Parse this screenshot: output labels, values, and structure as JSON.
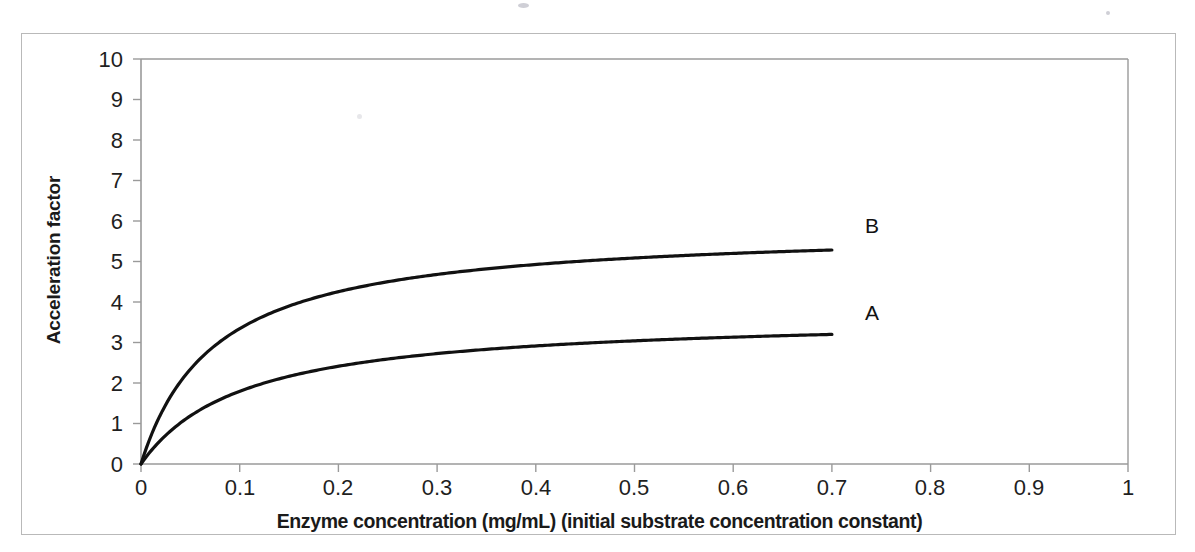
{
  "figure": {
    "background_color": "#ffffff",
    "border_color": "#b9b9b9"
  },
  "chart_data": {
    "type": "line",
    "title": "",
    "xlabel": "Enzyme concentration (mg/mL)  (initial substrate concentration constant)",
    "ylabel": "Acceleration factor",
    "xlim": [
      0,
      1
    ],
    "ylim": [
      0,
      10
    ],
    "xticks": [
      0,
      0.1,
      0.2,
      0.3,
      0.4,
      0.5,
      0.6,
      0.7,
      0.8,
      0.9,
      1
    ],
    "xtick_labels": [
      "0",
      "0.1",
      "0.2",
      "0.3",
      "0.4",
      "0.5",
      "0.6",
      "0.7",
      "0.8",
      "0.9",
      "1"
    ],
    "yticks": [
      0,
      1,
      2,
      3,
      4,
      5,
      6,
      7,
      8,
      9,
      10
    ],
    "ytick_labels": [
      "0",
      "1",
      "2",
      "3",
      "4",
      "5",
      "6",
      "7",
      "8",
      "9",
      "10"
    ],
    "grid": false,
    "legend": "inline end-of-curve labels",
    "line_color": "#111111",
    "line_width": 3.2,
    "x": [
      0,
      0.025,
      0.05,
      0.075,
      0.1,
      0.125,
      0.15,
      0.175,
      0.2,
      0.25,
      0.3,
      0.35,
      0.4,
      0.45,
      0.5,
      0.55,
      0.6,
      0.65,
      0.7
    ],
    "series": [
      {
        "name": "B",
        "label": "B",
        "plateau": 5.85,
        "half_saturation": 0.075,
        "values": [
          0,
          1.46,
          2.34,
          2.93,
          3.34,
          3.66,
          3.9,
          4.1,
          4.25,
          4.5,
          4.68,
          4.8,
          4.9,
          4.97,
          5.03,
          5.08,
          5.12,
          5.15,
          5.18
        ]
      },
      {
        "name": "A",
        "label": "A",
        "plateau": 3.68,
        "half_saturation": 0.105,
        "values": [
          0,
          0.71,
          1.19,
          1.53,
          1.79,
          2.0,
          2.16,
          2.3,
          2.41,
          2.58,
          2.71,
          2.8,
          2.87,
          2.93,
          2.98,
          3.02,
          3.05,
          3.08,
          3.1
        ]
      }
    ],
    "annotations": [
      {
        "text": "B",
        "series": "B",
        "x": 0.7,
        "y": 5.85
      },
      {
        "text": "A",
        "series": "A",
        "x": 0.7,
        "y": 3.68
      }
    ]
  }
}
